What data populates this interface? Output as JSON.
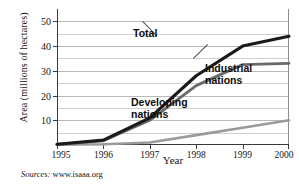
{
  "chart_data": {
    "type": "line",
    "title": "",
    "xlabel": "Year",
    "ylabel": "Area (millions of hectares)",
    "x": [
      1995,
      1996,
      1997,
      1998,
      1999,
      2000
    ],
    "xtick_labels": [
      "1995",
      "1996",
      "1997",
      "1998",
      "1999",
      "2000"
    ],
    "ytick_labels": [
      "10",
      "20",
      "30",
      "40",
      "50"
    ],
    "ytick_values": [
      10,
      20,
      30,
      40,
      50
    ],
    "minor_gridline_values": [
      5,
      15,
      25,
      35,
      45
    ],
    "xlim": [
      1995,
      2000
    ],
    "ylim": [
      0,
      55
    ],
    "grid": "horizontal",
    "legend_position": "inline-annotations",
    "series": [
      {
        "name": "Total",
        "label": "Total",
        "color": "#1a1a1a",
        "width": 3.1,
        "values": [
          0.3,
          2.0,
          11.0,
          28.0,
          40.0,
          44.0
        ]
      },
      {
        "name": "Industrial nations",
        "label_line1": "Industrial",
        "label_line2": "nations",
        "color": "#6a6a6a",
        "width": 2.8,
        "values": [
          0.2,
          1.7,
          10.0,
          24.0,
          32.5,
          33.0
        ]
      },
      {
        "name": "Developing nations",
        "label_line1": "Developing",
        "label_line2": "nations",
        "color": "#9a9a9a",
        "width": 2.6,
        "values": [
          0.1,
          0.3,
          1.0,
          4.0,
          7.0,
          10.0
        ]
      }
    ]
  },
  "source": {
    "prefix": "Sources:",
    "value": "www.isaaa.org"
  },
  "colors": {
    "total": "#1a1a1a",
    "industrial": "#6a6a6a",
    "developing": "#9a9a9a",
    "gridline": "#b9b9b9",
    "axis": "#3a3a3a",
    "text": "#151515",
    "background": "#ffffff"
  }
}
